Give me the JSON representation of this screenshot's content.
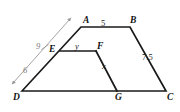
{
  "figure": {
    "type": "geometry-diagram",
    "canvas": {
      "width": 180,
      "height": 112
    },
    "stroke_color": "#1a1a1a",
    "dimension_color": "#9a9a9a",
    "background": "#ffffff",
    "vertices": [
      {
        "id": "A",
        "label": "A",
        "x": 81,
        "y": 27,
        "label_x": 83,
        "label_y": 16
      },
      {
        "id": "B",
        "label": "B",
        "x": 130,
        "y": 27,
        "label_x": 130,
        "label_y": 16
      },
      {
        "id": "C",
        "label": "C",
        "x": 166,
        "y": 91,
        "label_x": 167,
        "label_y": 93
      },
      {
        "id": "D",
        "label": "D",
        "x": 22,
        "y": 91,
        "label_x": 13,
        "label_y": 93
      },
      {
        "id": "E",
        "label": "E",
        "x": 60,
        "y": 51,
        "label_x": 49,
        "label_y": 45
      },
      {
        "id": "F",
        "label": "F",
        "x": 96,
        "y": 51,
        "label_x": 97,
        "label_y": 42
      },
      {
        "id": "G",
        "label": "G",
        "x": 117,
        "y": 91,
        "label_x": 115,
        "label_y": 93
      }
    ],
    "edges": [
      {
        "id": "AB",
        "from": "A",
        "to": "B"
      },
      {
        "id": "BC",
        "from": "B",
        "to": "C"
      },
      {
        "id": "DC",
        "from": "D",
        "to": "C"
      },
      {
        "id": "DA",
        "from": "D",
        "to": "A"
      },
      {
        "id": "EF",
        "from": "E",
        "to": "F"
      },
      {
        "id": "FG",
        "from": "F",
        "to": "G"
      }
    ],
    "measure_labels": [
      {
        "id": "AB",
        "text": "5",
        "x": 101,
        "y": 19,
        "italic": false
      },
      {
        "id": "BC",
        "text": "7.5",
        "x": 142,
        "y": 53,
        "italic": false
      },
      {
        "id": "EF",
        "text": "y",
        "x": 75,
        "y": 42,
        "italic": true
      },
      {
        "id": "FG",
        "text": "x",
        "x": 102,
        "y": 62,
        "italic": true
      }
    ],
    "dimension_line": {
      "from_x": 13,
      "from_y": 83,
      "to_x": 70,
      "to_y": 19,
      "tick_x": 45,
      "tick_y": 47,
      "upper_label": "9",
      "upper_label_x": 36,
      "upper_label_y": 42,
      "lower_label": "6",
      "lower_label_x": 23,
      "lower_label_y": 66
    }
  }
}
